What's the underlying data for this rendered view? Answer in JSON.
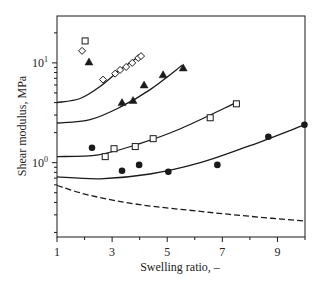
{
  "chart_data": {
    "type": "scatter",
    "title": "",
    "xlabel": "Swelling ratio, –",
    "ylabel": "Shear modulus, MPa",
    "xlim": [
      1,
      10
    ],
    "ylim": [
      0.18,
      29.5
    ],
    "yscale": "log",
    "grid": false,
    "legend": "none",
    "x_ticks": [
      {
        "value": 1,
        "label": "1"
      },
      {
        "value": 3,
        "label": "3"
      },
      {
        "value": 5,
        "label": "5"
      },
      {
        "value": 7,
        "label": "7"
      },
      {
        "value": 9,
        "label": "9"
      }
    ],
    "x_minor_ticks": [
      2,
      4,
      6,
      8,
      10
    ],
    "y_ticks": [
      {
        "value": 1,
        "base": "10",
        "exp": "0"
      },
      {
        "value": 10,
        "base": "10",
        "exp": "1"
      }
    ],
    "y_minor_ticks": [
      0.2,
      0.3,
      0.4,
      0.5,
      0.6,
      0.7,
      0.8,
      0.9,
      2,
      3,
      4,
      5,
      6,
      7,
      8,
      9,
      20
    ],
    "series": [
      {
        "name": "diamonds",
        "marker": "diamond-open",
        "x": [
          1.91,
          2.67,
          3.11,
          3.29,
          3.51,
          3.73,
          3.95,
          4.05
        ],
        "y": [
          13.2,
          6.8,
          7.8,
          8.5,
          9.1,
          10.0,
          11.2,
          11.7
        ]
      },
      {
        "name": "squares",
        "marker": "square-open",
        "x": [
          2.02,
          2.75,
          3.07,
          3.84,
          4.49,
          6.56,
          7.51
        ],
        "y": [
          16.6,
          1.15,
          1.38,
          1.45,
          1.74,
          2.82,
          3.89
        ]
      },
      {
        "name": "triangles",
        "marker": "triangle-filled",
        "x": [
          2.16,
          3.36,
          3.76,
          4.16,
          4.85,
          5.58
        ],
        "y": [
          10.2,
          4.0,
          4.2,
          6.0,
          7.6,
          8.9
        ]
      },
      {
        "name": "circles",
        "marker": "circle-filled",
        "x": [
          2.27,
          3.36,
          3.98,
          5.04,
          6.82,
          8.67,
          9.98
        ],
        "y": [
          1.41,
          0.83,
          0.95,
          0.81,
          0.95,
          1.82,
          2.4
        ]
      }
    ],
    "curves": [
      {
        "name": "fit-diamonds",
        "style": "solid",
        "x": [
          1,
          1.84,
          2.56,
          3.29,
          4.05
        ],
        "y": [
          4.0,
          4.4,
          5.8,
          8.5,
          12.0
        ]
      },
      {
        "name": "fit-triangles",
        "style": "solid",
        "x": [
          1,
          2.2,
          3.29,
          4.38,
          5.55
        ],
        "y": [
          2.5,
          2.7,
          3.6,
          5.4,
          9.5
        ]
      },
      {
        "name": "fit-squares",
        "style": "solid",
        "x": [
          1,
          2.5,
          4.0,
          5.5,
          7.5
        ],
        "y": [
          1.15,
          1.2,
          1.55,
          2.2,
          4.0
        ]
      },
      {
        "name": "fit-circles",
        "style": "solid",
        "x": [
          1,
          2.56,
          4.38,
          6.2,
          8.0,
          10
        ],
        "y": [
          0.72,
          0.69,
          0.77,
          1.0,
          1.48,
          2.4
        ]
      },
      {
        "name": "dashed-reference",
        "style": "dashed",
        "x": [
          1,
          2.2,
          4.0,
          6.2,
          8.0,
          10
        ],
        "y": [
          0.59,
          0.47,
          0.38,
          0.325,
          0.29,
          0.26
        ]
      }
    ],
    "colors": {
      "ink": "#1a1a1a"
    }
  }
}
